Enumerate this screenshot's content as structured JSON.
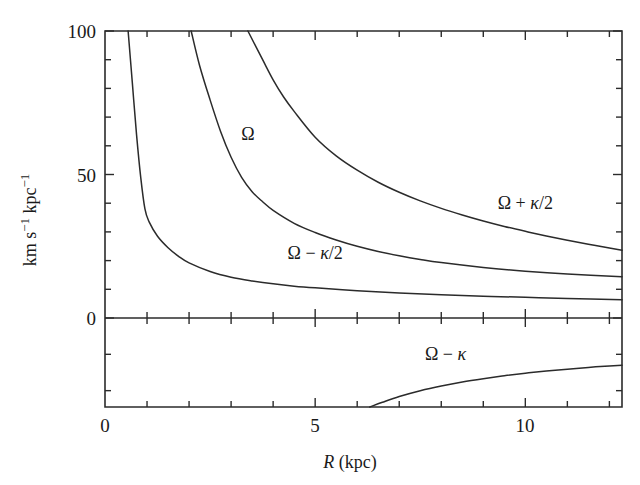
{
  "chart_data": {
    "type": "line",
    "title": "",
    "xlabel": "R (kpc)",
    "ylabel": "km s−1 kpc−1",
    "xlim": [
      0,
      12.3
    ],
    "ylim": [
      -24.5,
      100
    ],
    "grid": false,
    "legend": "inline-annotations",
    "panels": [
      {
        "name": "upper-panel",
        "ylim": [
          0,
          100
        ],
        "yticks_major": [
          0,
          50,
          100
        ],
        "yticks_major_labels": [
          "0",
          "50",
          "100"
        ],
        "yticks_minor": [
          10,
          20,
          30,
          40,
          60,
          70,
          80,
          90
        ]
      },
      {
        "name": "lower-panel",
        "ylim": [
          -24.5,
          0
        ],
        "yticks_minor": [
          -10,
          -20
        ]
      }
    ],
    "xticks_major": [
      0,
      5,
      10
    ],
    "xticks_major_labels": [
      "0",
      "5",
      "10"
    ],
    "xticks_minor": [
      1,
      2,
      3,
      4,
      6,
      7,
      8,
      9,
      11,
      12
    ],
    "series": [
      {
        "name": "Ω − κ/2",
        "label": "Ω − κ/2",
        "label_x": 5.0,
        "label_y": 20.5,
        "points": [
          [
            0.55,
            100
          ],
          [
            0.65,
            82
          ],
          [
            0.75,
            64
          ],
          [
            0.85,
            49
          ],
          [
            0.95,
            38
          ],
          [
            1.05,
            33.5
          ],
          [
            1.25,
            28.5
          ],
          [
            1.5,
            24.5
          ],
          [
            1.75,
            21.5
          ],
          [
            2.0,
            19.2
          ],
          [
            2.5,
            16.2
          ],
          [
            3.0,
            14.2
          ],
          [
            3.5,
            12.9
          ],
          [
            4.0,
            11.9
          ],
          [
            4.5,
            11.1
          ],
          [
            5.0,
            10.5
          ],
          [
            6.0,
            9.5
          ],
          [
            7.0,
            8.7
          ],
          [
            8.0,
            8.1
          ],
          [
            9.0,
            7.6
          ],
          [
            10.0,
            7.2
          ],
          [
            11.0,
            6.8
          ],
          [
            12.3,
            6.4
          ]
        ]
      },
      {
        "name": "Ω",
        "label": "Ω",
        "label_x": 3.4,
        "label_y": 62.0,
        "points": [
          [
            2.05,
            100
          ],
          [
            2.25,
            88
          ],
          [
            2.5,
            76
          ],
          [
            2.75,
            65
          ],
          [
            3.0,
            56
          ],
          [
            3.25,
            49
          ],
          [
            3.5,
            44
          ],
          [
            3.75,
            40.5
          ],
          [
            4.0,
            37.5
          ],
          [
            4.5,
            33.0
          ],
          [
            5.0,
            29.8
          ],
          [
            5.5,
            27.2
          ],
          [
            6.0,
            25.0
          ],
          [
            6.5,
            23.2
          ],
          [
            7.0,
            21.7
          ],
          [
            7.5,
            20.4
          ],
          [
            8.0,
            19.3
          ],
          [
            9.0,
            17.6
          ],
          [
            10.0,
            16.3
          ],
          [
            11.0,
            15.3
          ],
          [
            12.3,
            14.4
          ]
        ]
      },
      {
        "name": "Ω + κ/2",
        "label": "Ω + κ/2",
        "label_x": 10.0,
        "label_y": 38.0,
        "points": [
          [
            3.4,
            100
          ],
          [
            3.75,
            90
          ],
          [
            4.0,
            83
          ],
          [
            4.25,
            77
          ],
          [
            4.5,
            72
          ],
          [
            5.0,
            63
          ],
          [
            5.5,
            56.5
          ],
          [
            6.0,
            51.5
          ],
          [
            6.5,
            47.3
          ],
          [
            7.0,
            43.8
          ],
          [
            7.5,
            40.8
          ],
          [
            8.0,
            38.2
          ],
          [
            8.5,
            35.9
          ],
          [
            9.0,
            33.8
          ],
          [
            9.5,
            31.9
          ],
          [
            10.0,
            30.2
          ],
          [
            10.5,
            28.6
          ],
          [
            11.0,
            27.1
          ],
          [
            11.5,
            25.7
          ],
          [
            12.0,
            24.4
          ],
          [
            12.3,
            23.6
          ]
        ]
      },
      {
        "name": "Ω − κ",
        "label": "Ω − κ",
        "label_x": 8.1,
        "label_y": -11.5,
        "points": [
          [
            6.3,
            -24.5
          ],
          [
            6.6,
            -23.2
          ],
          [
            7.0,
            -21.6
          ],
          [
            7.5,
            -20.0
          ],
          [
            8.0,
            -18.7
          ],
          [
            8.5,
            -17.6
          ],
          [
            9.0,
            -16.7
          ],
          [
            9.5,
            -15.9
          ],
          [
            10.0,
            -15.2
          ],
          [
            10.5,
            -14.6
          ],
          [
            11.0,
            -14.1
          ],
          [
            11.5,
            -13.6
          ],
          [
            12.0,
            -13.2
          ],
          [
            12.3,
            -13.0
          ]
        ]
      }
    ]
  },
  "axes": {
    "x_title": "R (kpc)",
    "x_title_italic": "R",
    "x_title_rest": " (kpc)",
    "y_title_parts": {
      "km": "km s",
      "sup1": "−1",
      "kpc": " kpc",
      "sup2": "−1"
    },
    "xtick_labels": [
      "0",
      "5",
      "10"
    ],
    "ytick_labels": [
      "0",
      "50",
      "100"
    ]
  },
  "colors": {
    "background": "#ffffff",
    "ink": "#2b2b2b",
    "text": "#1a1a1a"
  }
}
